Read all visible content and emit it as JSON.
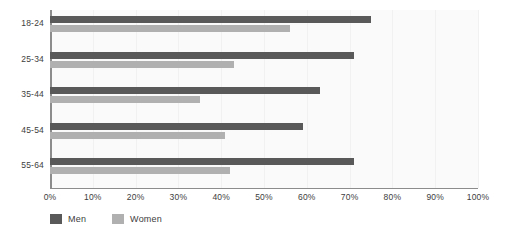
{
  "chart_data": {
    "type": "bar",
    "orientation": "horizontal",
    "title": "",
    "subtitle": "",
    "xlabel": "",
    "ylabel": "",
    "xlim": [
      0,
      100
    ],
    "xticks": [
      "0%",
      "10%",
      "20%",
      "30%",
      "40%",
      "50%",
      "60%",
      "70%",
      "80%",
      "90%",
      "100%"
    ],
    "xtick_values": [
      0,
      10,
      20,
      30,
      40,
      50,
      60,
      70,
      80,
      90,
      100
    ],
    "categories": [
      "18-24",
      "25-34",
      "35-44",
      "45-54",
      "55-64"
    ],
    "grid": "vertical-light",
    "legend_position": "bottom-left",
    "series": [
      {
        "name": "Men",
        "color": "#595959",
        "values": [
          75,
          71,
          63,
          59,
          71
        ]
      },
      {
        "name": "Women",
        "color": "#b0b0b0",
        "values": [
          56,
          43,
          35,
          41,
          42
        ]
      }
    ]
  },
  "legend": {
    "items": [
      {
        "label": "Men",
        "color": "#595959"
      },
      {
        "label": "Women",
        "color": "#b0b0b0"
      }
    ]
  },
  "colors": {
    "men": "#595959",
    "women": "#b0b0b0",
    "axis": "#8c8c8c",
    "text": "#3d3d3d",
    "plot_background": "#fafafa",
    "gridline": "#f1f1f1"
  }
}
